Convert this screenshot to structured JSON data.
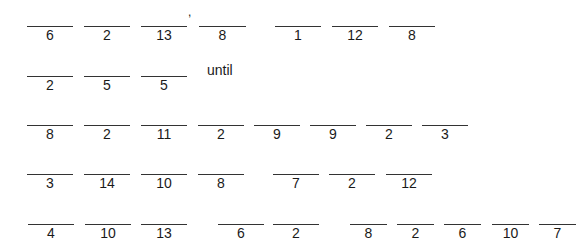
{
  "puzzle": {
    "rows": [
      {
        "blanks": [
          {
            "code": "6",
            "x": 27,
            "w": 46
          },
          {
            "code": "2",
            "x": 84,
            "w": 46
          },
          {
            "code": "13",
            "x": 141,
            "w": 46
          },
          {
            "code": "8",
            "x": 199,
            "w": 47
          },
          {
            "code": "1",
            "x": 275,
            "w": 46
          },
          {
            "code": "12",
            "x": 332,
            "w": 46
          },
          {
            "code": "8",
            "x": 389,
            "w": 46
          }
        ],
        "line_y": 26,
        "punctuation": {
          "text": ",",
          "x": 188,
          "y": 6
        }
      },
      {
        "blanks": [
          {
            "code": "2",
            "x": 27,
            "w": 46
          },
          {
            "code": "5",
            "x": 84,
            "w": 46
          },
          {
            "code": "5",
            "x": 141,
            "w": 46
          }
        ],
        "line_y": 76,
        "word": {
          "text": "until",
          "x": 207,
          "y": 62
        }
      },
      {
        "blanks": [
          {
            "code": "8",
            "x": 27,
            "w": 46
          },
          {
            "code": "2",
            "x": 84,
            "w": 46
          },
          {
            "code": "11",
            "x": 141,
            "w": 46
          },
          {
            "code": "2",
            "x": 198,
            "w": 46
          },
          {
            "code": "9",
            "x": 254,
            "w": 46
          },
          {
            "code": "9",
            "x": 310,
            "w": 46
          },
          {
            "code": "2",
            "x": 366,
            "w": 46
          },
          {
            "code": "3",
            "x": 422,
            "w": 46
          }
        ],
        "line_y": 125
      },
      {
        "blanks": [
          {
            "code": "3",
            "x": 27,
            "w": 46
          },
          {
            "code": "14",
            "x": 84,
            "w": 46
          },
          {
            "code": "10",
            "x": 141,
            "w": 46
          },
          {
            "code": "8",
            "x": 198,
            "w": 46
          },
          {
            "code": "7",
            "x": 273,
            "w": 46
          },
          {
            "code": "2",
            "x": 329,
            "w": 46
          },
          {
            "code": "12",
            "x": 386,
            "w": 46
          }
        ],
        "line_y": 174
      },
      {
        "blanks": [
          {
            "code": "4",
            "x": 28,
            "w": 46
          },
          {
            "code": "10",
            "x": 85,
            "w": 46
          },
          {
            "code": "13",
            "x": 141,
            "w": 46
          },
          {
            "code": "6",
            "x": 218,
            "w": 46
          },
          {
            "code": "2",
            "x": 273,
            "w": 46
          },
          {
            "code": "8",
            "x": 350,
            "w": 37
          },
          {
            "code": "2",
            "x": 397,
            "w": 37
          },
          {
            "code": "6",
            "x": 444,
            "w": 37
          },
          {
            "code": "10",
            "x": 492,
            "w": 37
          },
          {
            "code": "7",
            "x": 539,
            "w": 37
          }
        ],
        "line_y": 224
      }
    ]
  }
}
